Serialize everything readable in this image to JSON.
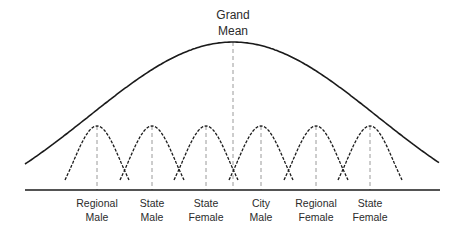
{
  "chart_data": {
    "type": "diagram",
    "title": "Grand Mean",
    "title_lines": [
      "Grand",
      "Mean"
    ],
    "grand_curve": {
      "style": "solid",
      "center_x": 233,
      "peak_y": 42,
      "left": [
        25,
        164
      ],
      "right": [
        440,
        162
      ]
    },
    "subgroups": [
      {
        "line1": "Regional",
        "line2": "Male",
        "center_x": 97
      },
      {
        "line1": "State",
        "line2": "Male",
        "center_x": 152
      },
      {
        "line1": "State",
        "line2": "Female",
        "center_x": 206
      },
      {
        "line1": "City",
        "line2": "Male",
        "center_x": 261
      },
      {
        "line1": "Regional",
        "line2": "Female",
        "center_x": 316
      },
      {
        "line1": "State",
        "line2": "Female",
        "center_x": 370
      }
    ],
    "sub_curve": {
      "style": "dashed",
      "peak_y": 126,
      "end_y": 180,
      "half_width": 32
    },
    "baseline": {
      "y": 190,
      "x1": 25,
      "x2": 440
    },
    "colors": {
      "line": "#1a1a1a",
      "dash_guide": "#9a9a9a",
      "text": "#2b2b2b"
    }
  }
}
